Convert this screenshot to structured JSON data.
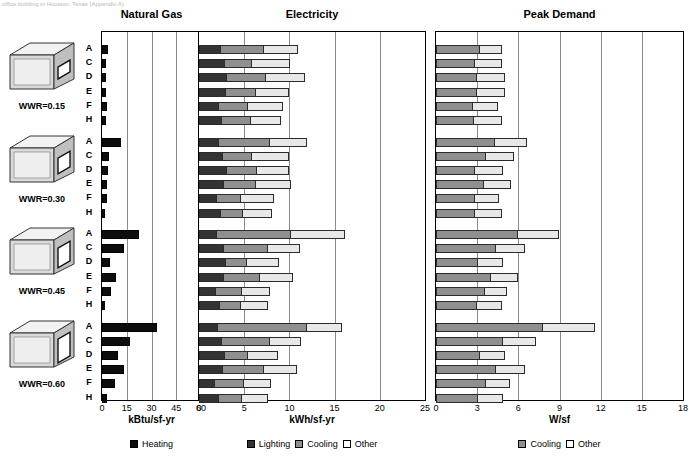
{
  "caption": "office building in Houston, Texas (Appendix A).",
  "legend_groups": [
    {
      "name": "natural-gas",
      "items": [
        {
          "label": "Heating",
          "key": "heating"
        }
      ]
    },
    {
      "name": "electricity",
      "items": [
        {
          "label": "Lighting",
          "key": "lighting"
        },
        {
          "label": "Cooling",
          "key": "cooling"
        },
        {
          "label": "Other",
          "key": "other"
        }
      ]
    },
    {
      "name": "peak-demand",
      "items": [
        {
          "label": "Cooling",
          "key": "cooling"
        },
        {
          "label": "Other",
          "key": "other"
        }
      ]
    }
  ],
  "colors": {
    "heating": "#0d0d0d",
    "lighting": "#333333",
    "cooling": "#8f8f8f",
    "other": "#e8e8e8",
    "gridline": "#8a8a8a",
    "frame": "#000000"
  },
  "groups": [
    {
      "wwr_label": "WWR=0.15",
      "wwr": 0.15
    },
    {
      "wwr_label": "WWR=0.30",
      "wwr": 0.3
    },
    {
      "wwr_label": "WWR=0.45",
      "wwr": 0.45
    },
    {
      "wwr_label": "WWR=0.60",
      "wwr": 0.6
    }
  ],
  "row_labels": [
    "A",
    "C",
    "D",
    "E",
    "F",
    "H"
  ],
  "chart_data": [
    {
      "type": "bar",
      "name": "natural-gas",
      "title": "Natural Gas",
      "xlabel": "kBtu/sf-yr",
      "ylabel": "",
      "xlim": [
        0,
        60
      ],
      "ticks": [
        0,
        15,
        30,
        45,
        60
      ],
      "grid": true,
      "orientation": "horizontal",
      "stacked": false,
      "categories": [
        "A",
        "C",
        "D",
        "E",
        "F",
        "H"
      ],
      "legend": [
        "Heating"
      ],
      "series": [
        {
          "name": "Heating",
          "color": "#0d0d0d",
          "groups": [
            {
              "wwr": "WWR=0.15",
              "values": [
                3.4,
                2.2,
                2.4,
                2.2,
                2.8,
                2.6
              ]
            },
            {
              "wwr": "WWR=0.30",
              "values": [
                11.8,
                4.4,
                3.6,
                3.0,
                3.2,
                2.0
              ]
            },
            {
              "wwr": "WWR=0.45",
              "values": [
                22.6,
                13.2,
                4.6,
                8.2,
                5.4,
                1.6
              ]
            },
            {
              "wwr": "WWR=0.60",
              "values": [
                33.4,
                17.0,
                9.6,
                13.4,
                8.0,
                3.2
              ]
            }
          ]
        }
      ]
    },
    {
      "type": "bar",
      "name": "electricity",
      "title": "Electricity",
      "xlabel": "kWh/sf-yr",
      "ylabel": "",
      "xlim": [
        0,
        25
      ],
      "ticks": [
        0,
        5,
        10,
        15,
        20,
        25
      ],
      "grid": true,
      "orientation": "horizontal",
      "stacked": true,
      "categories": [
        "A",
        "C",
        "D",
        "E",
        "F",
        "H"
      ],
      "legend": [
        "Lighting",
        "Cooling",
        "Other"
      ],
      "series": [
        {
          "name": "Lighting",
          "color": "#333333",
          "groups": [
            {
              "wwr": "WWR=0.15",
              "values": [
                2.3,
                2.8,
                3.0,
                2.9,
                2.1,
                2.4
              ]
            },
            {
              "wwr": "WWR=0.30",
              "values": [
                2.1,
                2.5,
                3.0,
                2.6,
                1.9,
                2.3
              ]
            },
            {
              "wwr": "WWR=0.45",
              "values": [
                1.9,
                2.6,
                2.9,
                2.6,
                1.8,
                2.2
              ]
            },
            {
              "wwr": "WWR=0.60",
              "values": [
                2.0,
                2.4,
                2.8,
                2.5,
                1.7,
                2.1
              ]
            }
          ]
        },
        {
          "name": "Cooling",
          "color": "#8f8f8f",
          "groups": [
            {
              "wwr": "WWR=0.15",
              "values": [
                4.8,
                3.0,
                4.3,
                3.3,
                3.2,
                3.2
              ]
            },
            {
              "wwr": "WWR=0.30",
              "values": [
                5.7,
                3.2,
                3.3,
                3.6,
                2.6,
                2.5
              ]
            },
            {
              "wwr": "WWR=0.45",
              "values": [
                8.2,
                4.9,
                2.3,
                4.0,
                2.9,
                2.3
              ]
            },
            {
              "wwr": "WWR=0.60",
              "values": [
                9.8,
                5.3,
                2.5,
                4.6,
                3.2,
                2.6
              ]
            }
          ]
        },
        {
          "name": "Other",
          "color": "#e8e8e8",
          "groups": [
            {
              "wwr": "WWR=0.15",
              "values": [
                3.8,
                4.3,
                4.4,
                3.8,
                4.0,
                3.5
              ]
            },
            {
              "wwr": "WWR=0.30",
              "values": [
                4.2,
                4.3,
                3.7,
                4.0,
                3.8,
                3.3
              ]
            },
            {
              "wwr": "WWR=0.45",
              "values": [
                6.0,
                3.7,
                3.6,
                3.8,
                3.2,
                3.1
              ]
            },
            {
              "wwr": "WWR=0.60",
              "values": [
                4.0,
                3.6,
                3.4,
                3.7,
                3.1,
                2.9
              ]
            }
          ]
        }
      ]
    },
    {
      "type": "bar",
      "name": "peak-demand",
      "title": "Peak Demand",
      "xlabel": "W/sf",
      "ylabel": "",
      "xlim": [
        0,
        18
      ],
      "ticks": [
        0,
        3,
        6,
        9,
        12,
        15,
        18
      ],
      "grid": true,
      "orientation": "horizontal",
      "stacked": true,
      "categories": [
        "A",
        "C",
        "D",
        "E",
        "F",
        "H"
      ],
      "legend": [
        "Cooling",
        "Other"
      ],
      "series": [
        {
          "name": "Cooling",
          "color": "#8f8f8f",
          "groups": [
            {
              "wwr": "WWR=0.15",
              "values": [
                3.1,
                2.8,
                2.9,
                2.9,
                2.6,
                2.7
              ]
            },
            {
              "wwr": "WWR=0.30",
              "values": [
                4.2,
                3.6,
                2.8,
                3.4,
                2.8,
                2.8
              ]
            },
            {
              "wwr": "WWR=0.45",
              "values": [
                5.9,
                4.3,
                3.0,
                3.9,
                3.5,
                2.9
              ]
            },
            {
              "wwr": "WWR=0.60",
              "values": [
                7.7,
                4.8,
                3.1,
                4.3,
                3.6,
                3.0
              ]
            }
          ]
        },
        {
          "name": "Other",
          "color": "#e8e8e8",
          "groups": [
            {
              "wwr": "WWR=0.15",
              "values": [
                1.7,
                2.0,
                2.1,
                2.1,
                1.9,
                2.1
              ]
            },
            {
              "wwr": "WWR=0.30",
              "values": [
                2.4,
                2.1,
                2.1,
                2.1,
                1.8,
                2.0
              ]
            },
            {
              "wwr": "WWR=0.45",
              "values": [
                3.1,
                2.2,
                1.9,
                2.1,
                1.7,
                1.9
              ]
            },
            {
              "wwr": "WWR=0.60",
              "values": [
                3.9,
                2.5,
                1.9,
                2.2,
                1.8,
                1.9
              ]
            }
          ]
        }
      ]
    }
  ]
}
